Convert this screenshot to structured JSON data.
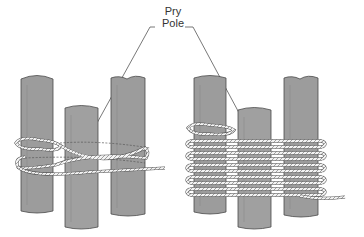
{
  "diagram": {
    "label": {
      "line1": "Pry",
      "line2": "Pole"
    },
    "colors": {
      "pole_fill": "#9a9a9a",
      "pole_stroke": "#4a4a4a",
      "rope": "#f2f2f2",
      "rope_stroke": "#5a5a5a",
      "leader": "#555555"
    },
    "panels": [
      {
        "name": "start-of-lashing",
        "description": "three poles with first turns of rope"
      },
      {
        "name": "completed-wraps",
        "description": "three poles with many wraps of rope"
      }
    ]
  }
}
